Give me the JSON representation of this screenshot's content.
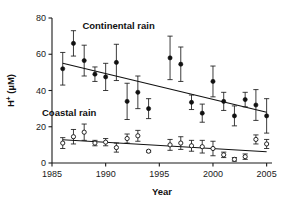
{
  "chart_data": {
    "type": "scatter",
    "title": "",
    "xlabel": "Year",
    "ylabel": "H+ (µM)",
    "ylabel_base": "H",
    "ylabel_sup": "+",
    "ylabel_unit": "(µM)",
    "xlim": [
      1985,
      2005.5
    ],
    "ylim": [
      0,
      80
    ],
    "xticks": [
      1985,
      1990,
      1995,
      2000,
      2005
    ],
    "yticks": [
      0,
      20,
      40,
      60,
      80
    ],
    "grid": false,
    "legend": "inline-annotations",
    "annotations": [
      {
        "text": "Continental rain",
        "x": 1991.2,
        "y": 74
      },
      {
        "text": "Coastal rain",
        "x": 1986.6,
        "y": 26
      }
    ],
    "series": [
      {
        "name": "Continental rain",
        "marker": "filled-circle",
        "color": "#111111",
        "x": [
          1986,
          1987,
          1988,
          1989,
          1990,
          1991,
          1992,
          1993,
          1994,
          1996,
          1997,
          1998,
          1999,
          2000,
          2001,
          2002,
          2003,
          2004,
          2005
        ],
        "y": [
          52.0,
          66.0,
          56.5,
          49.0,
          47.5,
          55.5,
          34.0,
          39.0,
          30.0,
          58.0,
          54.5,
          33.5,
          27.5,
          45.0,
          34.0,
          26.0,
          35.0,
          32.0,
          26.0
        ],
        "yerr": [
          9.0,
          7.0,
          8.5,
          4.0,
          7.5,
          10.0,
          10.0,
          9.0,
          5.5,
          12.0,
          9.5,
          4.0,
          5.0,
          8.5,
          5.0,
          5.5,
          4.0,
          8.5,
          9.5
        ],
        "trend": {
          "x1": 1986,
          "y1": 55.0,
          "x2": 2005,
          "y2": 28.0
        }
      },
      {
        "name": "Coastal rain",
        "marker": "open-circle",
        "color": "#111111",
        "x": [
          1986,
          1987,
          1988,
          1989,
          1990,
          1991,
          1992,
          1993,
          1994,
          1996,
          1997,
          1998,
          1999,
          2000,
          2001,
          2002,
          2003,
          2004,
          2005
        ],
        "y": [
          11.0,
          14.5,
          17.0,
          11.0,
          11.5,
          8.5,
          13.5,
          15.0,
          6.5,
          10.0,
          11.0,
          9.5,
          9.0,
          8.0,
          4.5,
          2.0,
          3.5,
          13.0,
          10.5
        ],
        "yerr": [
          3.0,
          4.0,
          4.5,
          1.5,
          2.0,
          2.5,
          2.5,
          3.0,
          0.5,
          3.0,
          3.5,
          3.0,
          3.5,
          4.0,
          1.5,
          1.0,
          1.5,
          2.5,
          2.5
        ],
        "trend": {
          "x1": 1986,
          "y1": 12.8,
          "x2": 2005,
          "y2": 6.2
        }
      }
    ]
  }
}
